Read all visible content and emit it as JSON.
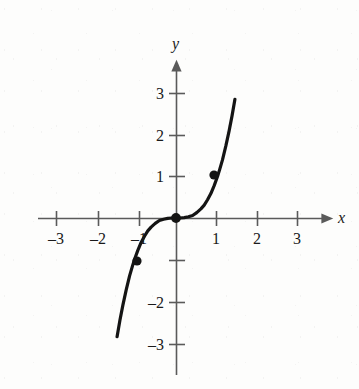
{
  "figure": {
    "width": 359,
    "height": 389,
    "background_color": "#fdfdfc",
    "ink_color": "#141414",
    "axis_color": "#5a5a5a"
  },
  "axes": {
    "x_axis_label": "x",
    "y_axis_label": "y",
    "origin_px": [
      176,
      218
    ],
    "unit_px": 41.5,
    "x_axis_start_px": 38,
    "x_axis_end_px": 330,
    "y_axis_top_px": 64,
    "y_axis_bottom_px": 375,
    "x_ticks": [
      {
        "value": -3,
        "label": "–3",
        "px": 56
      },
      {
        "value": -2,
        "label": "–2",
        "px": 98
      },
      {
        "value": -1,
        "label": "–1",
        "px": 139
      },
      {
        "value": 1,
        "label": "1",
        "px": 216
      },
      {
        "value": 2,
        "label": "2",
        "px": 257
      },
      {
        "value": 3,
        "label": "3",
        "px": 297
      }
    ],
    "y_ticks": [
      {
        "value": 3,
        "label": "3",
        "px": 93
      },
      {
        "value": 2,
        "label": "2",
        "px": 135
      },
      {
        "value": 1,
        "label": "1",
        "px": 176
      },
      {
        "value": -1,
        "label": "",
        "px": 260
      },
      {
        "value": -2,
        "label": "–2",
        "px": 302
      },
      {
        "value": -3,
        "label": "–3",
        "px": 344
      }
    ]
  },
  "chart_data": {
    "type": "line",
    "title": "",
    "subtitle": "",
    "xlabel": "x",
    "ylabel": "y",
    "xlim": [
      -3.4,
      3.7
    ],
    "ylim": [
      -3.8,
      3.8
    ],
    "grid": false,
    "legend": null,
    "series": [
      {
        "name": "y = x³",
        "equation": "y = x^3",
        "x": [
          -1.42,
          -1.35,
          -1.28,
          -1.2,
          -1.12,
          -1.05,
          -1.0,
          -0.92,
          -0.84,
          -0.76,
          -0.68,
          -0.6,
          -0.5,
          -0.4,
          -0.3,
          -0.2,
          -0.1,
          0.0,
          0.1,
          0.2,
          0.3,
          0.4,
          0.5,
          0.6,
          0.68,
          0.76,
          0.84,
          0.92,
          1.0,
          1.05,
          1.12,
          1.2,
          1.28,
          1.35,
          1.42
        ],
        "y": [
          -2.86,
          -2.46,
          -2.1,
          -1.73,
          -1.4,
          -1.16,
          -1.0,
          -0.78,
          -0.59,
          -0.44,
          -0.31,
          -0.22,
          -0.13,
          -0.06,
          -0.03,
          -0.01,
          0.0,
          0.0,
          0.0,
          0.01,
          0.03,
          0.06,
          0.13,
          0.22,
          0.31,
          0.44,
          0.59,
          0.78,
          1.0,
          1.16,
          1.4,
          1.73,
          2.1,
          2.46,
          2.86
        ],
        "line_width": 3.2,
        "color": "#141414"
      }
    ],
    "marked_points": [
      {
        "label": "",
        "x": -1,
        "y": -1,
        "px": [
          137,
          261
        ]
      },
      {
        "label": "",
        "x": 0,
        "y": 0,
        "px": [
          176,
          218
        ]
      },
      {
        "label": "",
        "x": 1,
        "y": 1,
        "px": [
          214,
          175
        ]
      }
    ],
    "x_ticks": [
      -3,
      -2,
      -1,
      1,
      2,
      3
    ],
    "y_ticks": [
      3,
      2,
      1,
      -1,
      -2,
      -3
    ],
    "x_tick_labels": [
      "–3",
      "–2",
      "–1",
      "1",
      "2",
      "3"
    ],
    "y_tick_labels": [
      "3",
      "2",
      "1",
      "",
      "–2",
      "–3"
    ]
  }
}
